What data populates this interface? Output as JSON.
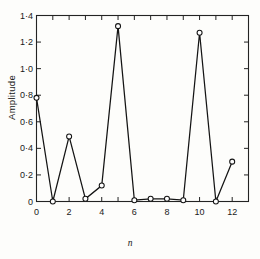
{
  "chart_data": {
    "type": "line",
    "title": "",
    "xlabel": "n",
    "ylabel": "Amplitude",
    "x": [
      0,
      1,
      2,
      3,
      4,
      5,
      6,
      7,
      8,
      9,
      10,
      11,
      12
    ],
    "values": [
      0.78,
      0.0,
      0.49,
      0.02,
      0.12,
      1.32,
      0.01,
      0.02,
      0.02,
      0.01,
      1.27,
      0.0,
      0.3
    ],
    "series": [
      {
        "name": "Amplitude",
        "values": [
          0.78,
          0.0,
          0.49,
          0.02,
          0.12,
          1.32,
          0.01,
          0.02,
          0.02,
          0.01,
          1.27,
          0.0,
          0.3
        ]
      }
    ],
    "xlim": [
      0,
      13
    ],
    "ylim": [
      0,
      1.4
    ],
    "xticks": [
      0,
      1,
      2,
      3,
      4,
      5,
      6,
      7,
      8,
      9,
      10,
      11,
      12,
      13
    ],
    "xtick_labels": [
      "0",
      "",
      "2",
      "",
      "4",
      "",
      "6",
      "",
      "8",
      "",
      "10",
      "",
      "12",
      ""
    ],
    "yticks": [
      0,
      0.2,
      0.4,
      0.6,
      0.8,
      1.0,
      1.2,
      1.4
    ],
    "ytick_labels": [
      "0",
      "0·2",
      "0·4",
      "0·6",
      "0·8",
      "1·0",
      "1·2",
      "1·4"
    ],
    "grid": false,
    "legend": null,
    "marker": "open-circle",
    "line_color": "#141414",
    "marker_color": "#141414",
    "frame": "box"
  }
}
